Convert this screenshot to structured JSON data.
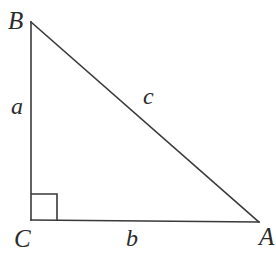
{
  "figure": {
    "kind": "right-triangle-diagram",
    "background_color": "#ffffff",
    "stroke_color": "#3a3a3a",
    "label_color": "#2b2b2b",
    "vertices": {
      "B": {
        "label": "B",
        "x": 31,
        "y": 22
      },
      "C": {
        "label": "C",
        "x": 31,
        "y": 220
      },
      "A": {
        "label": "A",
        "x": 259,
        "y": 222
      }
    },
    "sides": {
      "a": {
        "label": "a",
        "from": "B",
        "to": "C",
        "description": "vertical leg"
      },
      "b": {
        "label": "b",
        "from": "C",
        "to": "A",
        "description": "horizontal leg"
      },
      "c": {
        "label": "c",
        "from": "B",
        "to": "A",
        "description": "hypotenuse"
      }
    },
    "right_angle": {
      "at_vertex": "C",
      "marker": "square",
      "size": 26
    }
  }
}
